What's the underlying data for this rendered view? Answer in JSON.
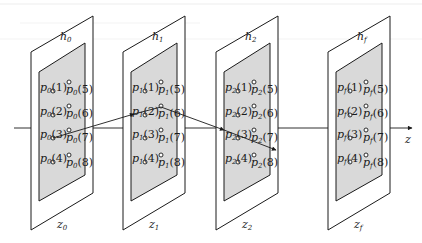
{
  "diagram": {
    "axis_label": "z",
    "planes": [
      {
        "id": "0",
        "h_label": "h",
        "h_sub": "0",
        "z_label": "z",
        "z_sub": "0",
        "p": "p",
        "p_sub": "0"
      },
      {
        "id": "1",
        "h_label": "h",
        "h_sub": "1",
        "z_label": "z",
        "z_sub": "1",
        "p": "p",
        "p_sub": "1"
      },
      {
        "id": "2",
        "h_label": "h",
        "h_sub": "2",
        "z_label": "z",
        "z_sub": "2",
        "p": "p",
        "p_sub": "2"
      },
      {
        "id": "f",
        "h_label": "h",
        "h_sub": "f",
        "z_label": "z",
        "z_sub": "f",
        "p": "p",
        "p_sub": "f"
      }
    ],
    "point_indices_left": [
      "(1)",
      "(2)",
      "(3)",
      "(4)"
    ],
    "point_indices_right": [
      "(5)",
      "(6)",
      "(7)",
      "(8)"
    ],
    "colors": {
      "ink": "#1a1a1a",
      "inner_fill": "#d9d9d9",
      "background": "#ffffff"
    }
  }
}
